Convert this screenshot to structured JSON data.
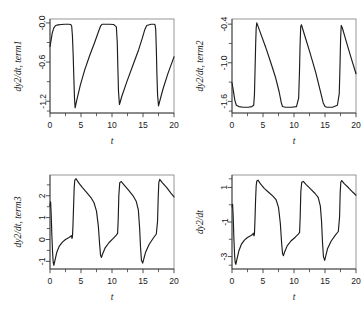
{
  "figure": {
    "title": "",
    "layout": "2x2 panel grid",
    "background": "#ffffff",
    "line_color": "#1c1c1c",
    "axis_color": "#3c3c3c"
  },
  "chart_data": [
    {
      "type": "line",
      "panel": 1,
      "title": "",
      "xlabel": "t",
      "ylabel": "dy2/dt, term1",
      "xlim": [
        0,
        20
      ],
      "ylim": [
        -1.38,
        0.06
      ],
      "xticks": [
        0,
        5,
        10,
        15,
        20
      ],
      "xticklabels": [
        "0",
        "5",
        "10",
        "15",
        "20"
      ],
      "xticks_minor": [
        2.5,
        7.5,
        12.5,
        17.5
      ],
      "yticks": [
        -0.0,
        -0.6,
        -1.2
      ],
      "yticklabels": [
        "-0.0",
        "-0.6",
        "-1.2"
      ],
      "yticks_minor": [
        -0.3,
        -0.9,
        -1.35
      ],
      "grid": false,
      "legend": null,
      "series": [
        {
          "name": "term1",
          "x": [
            0.0,
            0.15,
            0.35,
            0.6,
            0.9,
            1.3,
            1.8,
            2.4,
            3.0,
            3.35,
            3.5,
            3.62,
            3.74,
            3.85,
            3.95,
            4.05,
            4.3,
            4.9,
            5.6,
            6.4,
            7.2,
            7.8,
            8.15,
            8.35,
            8.45,
            8.6,
            9.6,
            10.3,
            10.7,
            10.85,
            10.95,
            11.05,
            11.2,
            11.6,
            12.4,
            13.4,
            14.3,
            14.9,
            15.3,
            15.6,
            16.3,
            16.8,
            16.95,
            17.05,
            17.15,
            17.25,
            17.35,
            17.5,
            18.2,
            19.0,
            20.0
          ],
          "y": [
            -0.36,
            -0.28,
            -0.16,
            -0.08,
            -0.04,
            -0.03,
            -0.025,
            -0.02,
            -0.02,
            -0.025,
            -0.05,
            -0.2,
            -0.5,
            -0.85,
            -1.15,
            -1.3,
            -1.19,
            -0.95,
            -0.72,
            -0.5,
            -0.3,
            -0.14,
            -0.05,
            -0.025,
            -0.02,
            -0.02,
            -0.02,
            -0.025,
            -0.06,
            -0.3,
            -0.7,
            -1.05,
            -1.25,
            -1.12,
            -0.9,
            -0.64,
            -0.41,
            -0.23,
            -0.1,
            -0.04,
            -0.02,
            -0.02,
            -0.03,
            -0.1,
            -0.4,
            -0.8,
            -1.1,
            -1.27,
            -1.02,
            -0.78,
            -0.52
          ]
        }
      ]
    },
    {
      "type": "line",
      "panel": 2,
      "title": "",
      "xlabel": "t",
      "ylabel": "dy2/dt, term2",
      "xlim": [
        0,
        20
      ],
      "ylim": [
        -1.78,
        -0.32
      ],
      "xticks": [
        0,
        5,
        10,
        15,
        20
      ],
      "xticklabels": [
        "0",
        "5",
        "10",
        "15",
        "20"
      ],
      "xticks_minor": [
        2.5,
        7.5,
        12.5,
        17.5
      ],
      "yticks": [
        -0.4,
        -1.0,
        -1.6
      ],
      "yticklabels": [
        "-0.4",
        "-1.0",
        "-1.6"
      ],
      "yticks_minor": [
        -0.7,
        -1.3,
        -1.75
      ],
      "grid": false,
      "legend": null,
      "series": [
        {
          "name": "term2",
          "x": [
            0.0,
            0.2,
            0.45,
            0.7,
            1.1,
            1.8,
            2.6,
            3.2,
            3.5,
            3.62,
            3.72,
            3.82,
            3.9,
            4.0,
            4.6,
            5.4,
            6.2,
            7.0,
            7.6,
            7.95,
            8.15,
            8.6,
            9.6,
            10.4,
            10.75,
            10.88,
            10.98,
            11.08,
            11.2,
            11.8,
            12.6,
            13.5,
            14.2,
            14.7,
            15.0,
            15.3,
            16.2,
            17.0,
            17.3,
            17.42,
            17.52,
            17.62,
            17.8,
            18.4,
            19.2,
            20.0
          ],
          "y": [
            -1.31,
            -1.42,
            -1.58,
            -1.66,
            -1.68,
            -1.69,
            -1.69,
            -1.68,
            -1.66,
            -1.5,
            -1.1,
            -0.7,
            -0.46,
            -0.38,
            -0.54,
            -0.75,
            -0.98,
            -1.22,
            -1.45,
            -1.62,
            -1.68,
            -1.69,
            -1.69,
            -1.68,
            -1.55,
            -1.15,
            -0.72,
            -0.44,
            -0.41,
            -0.6,
            -0.85,
            -1.15,
            -1.42,
            -1.62,
            -1.68,
            -1.69,
            -1.69,
            -1.66,
            -1.48,
            -1.05,
            -0.62,
            -0.42,
            -0.46,
            -0.66,
            -0.92,
            -1.17
          ]
        }
      ]
    },
    {
      "type": "line",
      "panel": 3,
      "title": "",
      "xlabel": "t",
      "ylabel": "dy2/dt, term3",
      "xlim": [
        0,
        20
      ],
      "ylim": [
        -1.35,
        2.95
      ],
      "xticks": [
        0,
        5,
        10,
        15,
        20
      ],
      "xticklabels": [
        "0",
        "5",
        "10",
        "15",
        "20"
      ],
      "xticks_minor": [
        2.5,
        7.5,
        12.5,
        17.5
      ],
      "yticks": [
        -1,
        0,
        1,
        2
      ],
      "yticklabels": [
        "-1",
        "0",
        "1",
        "2"
      ],
      "yticks_minor": [
        -0.5,
        0.5,
        1.5,
        2.5
      ],
      "grid": false,
      "legend": null,
      "series": [
        {
          "name": "term3",
          "x": [
            0.0,
            0.1,
            0.2,
            0.3,
            0.42,
            0.52,
            0.62,
            0.8,
            1.1,
            1.5,
            2.0,
            2.5,
            3.0,
            3.3,
            3.45,
            3.55,
            3.62,
            3.7,
            3.8,
            3.9,
            4.0,
            4.2,
            4.6,
            5.2,
            5.9,
            6.6,
            7.1,
            7.5,
            7.8,
            8.0,
            8.15,
            8.3,
            8.5,
            8.9,
            9.5,
            10.2,
            10.7,
            10.9,
            11.0,
            11.1,
            11.25,
            11.5,
            12.0,
            12.7,
            13.4,
            13.9,
            14.25,
            14.45,
            14.6,
            14.75,
            14.95,
            15.4,
            16.0,
            16.7,
            17.15,
            17.35,
            17.45,
            17.55,
            17.7,
            18.1,
            18.8,
            19.5,
            20.0
          ],
          "y": [
            1.55,
            1.72,
            1.1,
            0.2,
            -0.62,
            -1.05,
            -1.18,
            -0.95,
            -0.58,
            -0.3,
            -0.12,
            0.0,
            0.08,
            0.14,
            0.18,
            0.05,
            0.12,
            0.6,
            1.5,
            2.35,
            2.72,
            2.78,
            2.6,
            2.38,
            2.15,
            1.92,
            1.68,
            1.3,
            0.6,
            -0.2,
            -0.72,
            -0.82,
            -0.65,
            -0.38,
            -0.15,
            0.05,
            0.2,
            0.28,
            0.9,
            2.0,
            2.6,
            2.65,
            2.48,
            2.25,
            2.0,
            1.75,
            1.35,
            0.55,
            -0.35,
            -0.95,
            -1.08,
            -0.6,
            -0.22,
            0.08,
            0.25,
            0.85,
            1.9,
            2.6,
            2.75,
            2.6,
            2.38,
            2.12,
            1.95
          ]
        }
      ]
    },
    {
      "type": "line",
      "panel": 4,
      "title": "",
      "xlabel": "t",
      "ylabel": "dy2/dt",
      "xlim": [
        0,
        20
      ],
      "ylim": [
        -3.72,
        1.72
      ],
      "xticks": [
        0,
        5,
        10,
        15,
        20
      ],
      "xticklabels": [
        "0",
        "5",
        "10",
        "15",
        "20"
      ],
      "xticks_minor": [
        2.5,
        7.5,
        12.5,
        17.5
      ],
      "yticks": [
        -3,
        -1,
        1
      ],
      "yticklabels": [
        "-3",
        "-1",
        "1"
      ],
      "yticks_minor": [
        -3.5,
        -2,
        0,
        1.5
      ],
      "grid": false,
      "legend": null,
      "series": [
        {
          "name": "dy2/dt",
          "x": [
            0.0,
            0.1,
            0.2,
            0.3,
            0.42,
            0.52,
            0.62,
            0.8,
            1.1,
            1.5,
            2.0,
            2.5,
            3.0,
            3.3,
            3.45,
            3.55,
            3.62,
            3.7,
            3.8,
            3.9,
            4.0,
            4.2,
            4.6,
            5.2,
            5.9,
            6.6,
            7.1,
            7.5,
            7.8,
            8.0,
            8.15,
            8.3,
            8.5,
            8.9,
            9.5,
            10.2,
            10.7,
            10.9,
            11.0,
            11.1,
            11.25,
            11.5,
            12.0,
            12.7,
            13.4,
            13.9,
            14.25,
            14.45,
            14.6,
            14.75,
            14.95,
            15.4,
            16.0,
            16.7,
            17.15,
            17.35,
            17.45,
            17.55,
            17.7,
            18.1,
            18.8,
            19.5,
            20.0
          ],
          "y": [
            -0.12,
            0.02,
            -0.75,
            -1.9,
            -2.92,
            -3.35,
            -3.45,
            -3.15,
            -2.68,
            -2.3,
            -2.05,
            -1.9,
            -1.8,
            -1.72,
            -1.65,
            -1.8,
            -1.7,
            -0.95,
            0.25,
            1.1,
            1.38,
            1.42,
            1.2,
            0.95,
            0.72,
            0.5,
            0.3,
            -0.15,
            -1.1,
            -2.2,
            -2.82,
            -2.95,
            -2.72,
            -2.38,
            -2.1,
            -1.88,
            -1.7,
            -1.6,
            -0.7,
            0.75,
            1.3,
            1.35,
            1.15,
            0.9,
            0.65,
            0.42,
            -0.08,
            -1.0,
            -2.2,
            -3.0,
            -3.22,
            -2.55,
            -2.1,
            -1.75,
            -1.55,
            -0.72,
            0.7,
            1.3,
            1.4,
            1.22,
            0.98,
            0.72,
            0.55
          ]
        }
      ]
    }
  ]
}
